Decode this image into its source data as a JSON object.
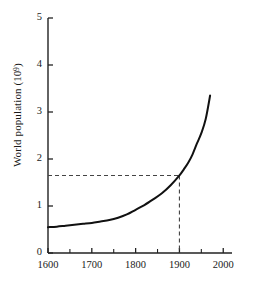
{
  "chart_data": {
    "type": "line",
    "title": "",
    "subtitle": "",
    "xlabel": "",
    "ylabel": "World population (10⁹)",
    "ylabel_base": "World population (10",
    "ylabel_exponent": "9",
    "ylabel_close": ")",
    "xlim": [
      1600,
      2020
    ],
    "ylim": [
      0,
      5
    ],
    "x_ticks": [
      1600,
      1700,
      1800,
      1900,
      2000
    ],
    "x_tick_labels": [
      "1600",
      "1700",
      "1800",
      "1900",
      "2000"
    ],
    "x_minor_tick_interval": 50,
    "y_ticks": [
      0,
      1,
      2,
      3,
      4,
      5
    ],
    "y_tick_labels": [
      "0",
      "1",
      "2",
      "3",
      "4",
      "5"
    ],
    "grid": false,
    "legend": null,
    "legend_position": "none",
    "series": [
      {
        "name": "World population",
        "color": "#111111",
        "x": [
          1600,
          1620,
          1640,
          1660,
          1680,
          1700,
          1720,
          1740,
          1760,
          1780,
          1800,
          1820,
          1840,
          1860,
          1880,
          1900,
          1910,
          1920,
          1930,
          1940,
          1950,
          1960,
          1970
        ],
        "values": [
          0.55,
          0.56,
          0.58,
          0.6,
          0.62,
          0.64,
          0.67,
          0.7,
          0.75,
          0.82,
          0.92,
          1.02,
          1.14,
          1.27,
          1.44,
          1.65,
          1.78,
          1.92,
          2.1,
          2.33,
          2.55,
          2.85,
          3.35
        ]
      }
    ],
    "annotations": [
      {
        "name": "guide-lines",
        "kind": "dashed-crosshair",
        "x": 1900,
        "y": 1.65,
        "color": "#333333"
      }
    ]
  },
  "geometry": {
    "plot_left": 48,
    "plot_right": 232,
    "plot_top": 18,
    "plot_bottom": 253
  },
  "colors": {
    "background": "#ffffff",
    "axis": "#222222",
    "curve": "#111111",
    "guide": "#444444",
    "text": "#1a1a1a"
  }
}
